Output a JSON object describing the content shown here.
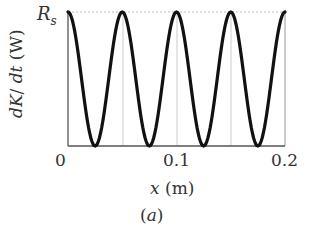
{
  "chart_data": {
    "type": "line",
    "title": "",
    "xlabel": "x (m)",
    "ylabel": "dK/dt (W)",
    "x_ticks": [
      "0",
      "0.1",
      "0.2"
    ],
    "y_ticks": [
      "R_s"
    ],
    "xlim": [
      0,
      0.2
    ],
    "ylim": [
      0,
      "R_s"
    ],
    "grid": "vertical lines at x = 0.05, 0.1, 0.15; dotted horizontal line at R_s",
    "function": "dK/dt = R_s * cos^2(2*pi*x/0.1)",
    "series": [
      {
        "name": "dK/dt",
        "x": [
          0,
          0.0125,
          0.025,
          0.0375,
          0.05,
          0.0625,
          0.075,
          0.0875,
          0.1,
          0.1125,
          0.125,
          0.1375,
          0.15,
          0.1625,
          0.175,
          0.1875,
          0.2
        ],
        "values_fraction_of_Rs": [
          1,
          0.854,
          0.5,
          0.146,
          0,
          0.146,
          0.5,
          0.854,
          1,
          0.854,
          0.5,
          0.146,
          0,
          0.146,
          0.5,
          0.854,
          1
        ]
      }
    ],
    "caption": "(a)"
  },
  "labels": {
    "y_top": "R",
    "y_top_sub": "s",
    "ylabel_part1": "dK",
    "ylabel_part2": "/ ",
    "ylabel_part3": "dt",
    "ylabel_part4": " (W)",
    "x_tick_0": "0",
    "x_tick_1": "0.1",
    "x_tick_2": "0.2",
    "xlabel_var": "x",
    "xlabel_unit": " (m)",
    "caption_open": "(",
    "caption_letter": "a",
    "caption_close": ")"
  },
  "colors": {
    "curve": "#111111",
    "axes": "#555555",
    "grid": "#bbbbbb"
  }
}
